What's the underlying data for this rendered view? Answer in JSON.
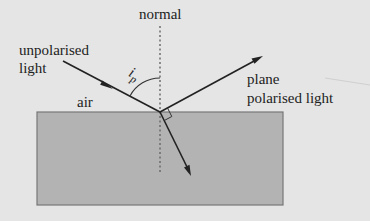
{
  "diagram": {
    "labels": {
      "normal": "normal",
      "incident_line1": "unpolarised",
      "incident_line2": "light",
      "reflected_line1": "plane",
      "reflected_line2": "polarised light",
      "medium_top": "air",
      "angle_symbol": "i",
      "angle_subscript": "p"
    },
    "colors": {
      "background": "#e5e5e5",
      "block_fill": "#b3b3b3",
      "block_border": "#777777",
      "ray": "#222222",
      "normal_line": "#666666"
    }
  }
}
